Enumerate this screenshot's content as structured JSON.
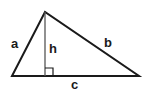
{
  "diagram": {
    "stroke_color": "#1a1a1a",
    "vertices": {
      "apex": [
        45,
        12
      ],
      "left": [
        12,
        76
      ],
      "right": [
        139,
        76
      ]
    },
    "labels": {
      "a": "a",
      "b": "b",
      "c": "c",
      "h": "h"
    },
    "right_angle_marker": true
  }
}
